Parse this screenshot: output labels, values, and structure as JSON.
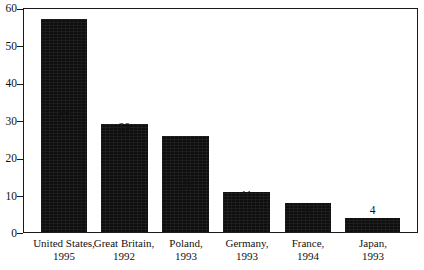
{
  "chart_data": {
    "type": "bar",
    "title": "",
    "subtitle": "",
    "xlabel": "",
    "ylabel": "",
    "ylim": [
      0,
      60
    ],
    "yticks": [
      0,
      10,
      20,
      30,
      40,
      50,
      60
    ],
    "grid": false,
    "legend": "none",
    "categories": [
      "United States,",
      "Great Britain,",
      "Poland,",
      "Germany,",
      "France,",
      "Japan,"
    ],
    "category_years": [
      "1995",
      "1992",
      "1993",
      "1993",
      "1994",
      "1993"
    ],
    "values": [
      57,
      29,
      26,
      11,
      8,
      4
    ],
    "value_labels": [
      "57",
      "29",
      "26",
      "11",
      "8",
      "4"
    ],
    "bar_color": "#0e0e0e",
    "axis_color": "#1a1a1a",
    "background_color": "#ffffff"
  },
  "axis": {
    "y_tick_labels": [
      "0",
      "10",
      "20",
      "30",
      "40",
      "50",
      "60"
    ]
  }
}
